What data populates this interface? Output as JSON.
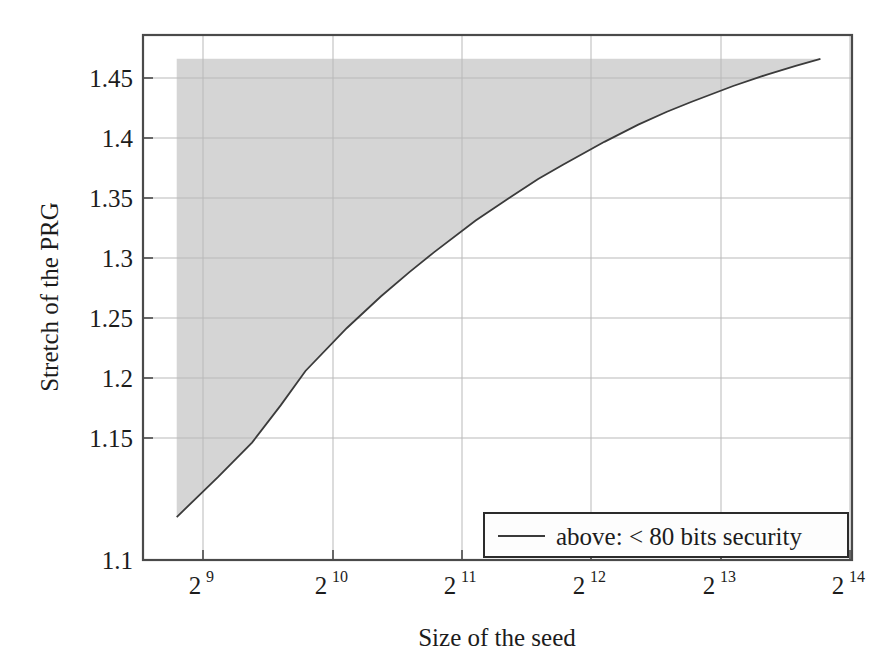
{
  "chart_data": {
    "type": "area",
    "title": "",
    "subtitle": "",
    "xlabel": "Size of the seed",
    "ylabel": "Stretch of the PRG",
    "xscale": "log2",
    "xlim": [
      427,
      19418
    ],
    "ylim": [
      1.1,
      1.4666
    ],
    "x_tick_labels": [
      "2",
      "2",
      "2",
      "2",
      "2",
      "2"
    ],
    "x_tick_exponents": [
      "9",
      "10",
      "11",
      "12",
      "13",
      "14"
    ],
    "x_tick_values": [
      512,
      1024,
      2048,
      4096,
      8192,
      16384
    ],
    "y_ticks": [
      1.1,
      1.15,
      1.2,
      1.25,
      1.3,
      1.35,
      1.4,
      1.45
    ],
    "y_tick_labels": [
      "1.1",
      "1.15",
      "1.2",
      "1.25",
      "1.3",
      "1.35",
      "1.4",
      "1.45"
    ],
    "grid": true,
    "legend_position": "bottom-right",
    "series": [
      {
        "name": "above: < 80 bits security",
        "type": "line",
        "color": "#3b3b3b",
        "fill_above": true,
        "fill_color": "#d5d5d5",
        "fill_top": 1.45,
        "x": [
          512,
          640,
          768,
          896,
          1024,
          1280,
          1536,
          1792,
          2048,
          2560,
          3072,
          3584,
          4096,
          5120,
          6144,
          7168,
          8192,
          10240,
          12288,
          14336,
          16384
        ],
        "y": [
          1.13,
          1.158,
          1.182,
          1.208,
          1.232,
          1.262,
          1.284,
          1.301,
          1.315,
          1.337,
          1.353,
          1.366,
          1.376,
          1.392,
          1.404,
          1.413,
          1.42,
          1.431,
          1.439,
          1.445,
          1.45
        ]
      }
    ],
    "annotations": []
  },
  "legend": {
    "entries": [
      {
        "label": "above: < 80 bits security",
        "marker": "line",
        "color": "#3b3b3b"
      }
    ]
  },
  "axes": {
    "x_title": "Size of the seed",
    "y_title": "Stretch of the PRG"
  }
}
